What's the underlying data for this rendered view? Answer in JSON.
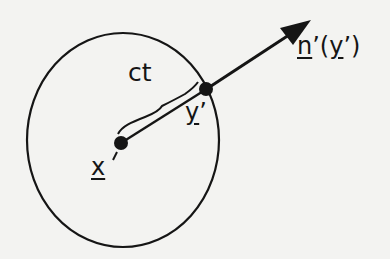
{
  "figure": {
    "colors": {
      "ink": "#151515",
      "paper": "#f3f3f1"
    },
    "labels": {
      "ct": "ct",
      "x_prime": {
        "symbol": "x",
        "prime": "’"
      },
      "y_prime": {
        "symbol": "y",
        "prime": "’"
      },
      "normal": {
        "symbol": "n",
        "prime": "’",
        "open": "(",
        "arg": "y",
        "arg_prime": "’",
        "close": ")"
      }
    },
    "shapes": {
      "circle": {
        "cx": 123,
        "cy": 140,
        "rx": 96,
        "ry": 107
      },
      "center_point": {
        "x": 121,
        "y": 143,
        "label": "x'"
      },
      "surface_point": {
        "x": 205,
        "y": 90,
        "label": "y'"
      },
      "normal_arrow": {
        "from": [
          205,
          90
        ],
        "to": [
          312,
          20
        ],
        "label": "n'(y')"
      },
      "radius_brace_label": "ct"
    }
  }
}
